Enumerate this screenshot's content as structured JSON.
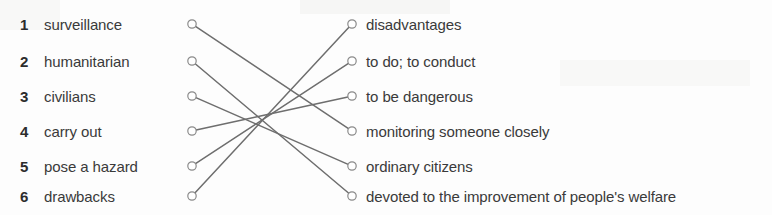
{
  "exercise": {
    "type": "matching-exercise",
    "title": "",
    "left_column": [
      {
        "number": "1",
        "term": "surveillance"
      },
      {
        "number": "2",
        "term": "humanitarian"
      },
      {
        "number": "3",
        "term": "civilians"
      },
      {
        "number": "4",
        "term": "carry out"
      },
      {
        "number": "5",
        "term": "pose a hazard"
      },
      {
        "number": "6",
        "term": "drawbacks"
      }
    ],
    "right_column": [
      {
        "index": 1,
        "definition": "disadvantages"
      },
      {
        "index": 2,
        "definition": "to do; to conduct"
      },
      {
        "index": 3,
        "definition": "to be dangerous"
      },
      {
        "index": 4,
        "definition": "monitoring someone closely"
      },
      {
        "index": 5,
        "definition": "ordinary citizens"
      },
      {
        "index": 6,
        "definition": "devoted to the improvement of people's welfare"
      }
    ],
    "connections": [
      {
        "from_row": 1,
        "to_row": 4
      },
      {
        "from_row": 2,
        "to_row": 6
      },
      {
        "from_row": 3,
        "to_row": 5
      },
      {
        "from_row": 4,
        "to_row": 3
      },
      {
        "from_row": 5,
        "to_row": 2
      },
      {
        "from_row": 6,
        "to_row": 1
      }
    ],
    "geometry": {
      "row_y": [
        24,
        61,
        96,
        131,
        166,
        196
      ],
      "left_dot_x": 192,
      "right_dot_x": 352,
      "dot_radius": 4.2
    },
    "colors": {
      "text": "#3a3a3a",
      "number": "#2c2c2c",
      "line": "#6e6e6e",
      "dot_stroke": "#8a8a8a",
      "background": "#fdfdfd"
    }
  }
}
